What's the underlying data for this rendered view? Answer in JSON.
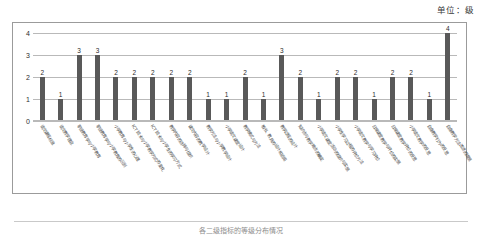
{
  "unit_note": "单位：级",
  "caption": "各二级指标的等级分布情况",
  "axis": {
    "y_ticks": [
      "4",
      "3",
      "2",
      "1",
      "0"
    ],
    "y_max": 4,
    "y_min": 0
  },
  "chart_data": {
    "type": "bar",
    "title": "",
    "subtitle": "",
    "xlabel": "",
    "ylabel": "单位：级",
    "ylim": [
      0,
      4
    ],
    "grid": true,
    "legend": "none",
    "bar_color": "#595959",
    "categories": [
      "语文课程标准",
      "语文教学理念",
      "职业教育学与小学教育",
      "职业教育学与小学教育的区别",
      "小学教育与小学生的心理",
      "ICT 技术与小学教学方式的变化",
      "ICT 技术与小学生的学习方式",
      "教学内容的选择与组织",
      "课文内容的教学设计",
      "教学方法与小学教学设计",
      "小学语文课堂设计",
      "教学模式与方法",
      "板书、教具的设计和运用",
      "教学过程的设计",
      "知识点与教学难点的确定",
      "小学语文课堂活动的组织与实施",
      "小学生学习过程的评价方法",
      "小学语文教学与学习评价",
      "日常课堂教学与评价的实施",
      "日常课堂教学评价的反思",
      "小学语文教学的反思",
      "自身教学行为的反思",
      "自身教学方法改进的措施"
    ],
    "values": [
      2,
      1,
      3,
      3,
      2,
      2,
      2,
      2,
      2,
      1,
      1,
      2,
      1,
      3,
      2,
      1,
      2,
      2,
      1,
      2,
      2,
      1,
      4
    ],
    "value_labels": [
      "2",
      "1",
      "3",
      "3",
      "2",
      "2",
      "2",
      "2",
      "2",
      "1",
      "1",
      "2",
      "1",
      "3",
      "2",
      "1",
      "2",
      "2",
      "1",
      "2",
      "2",
      "1",
      "4"
    ]
  }
}
